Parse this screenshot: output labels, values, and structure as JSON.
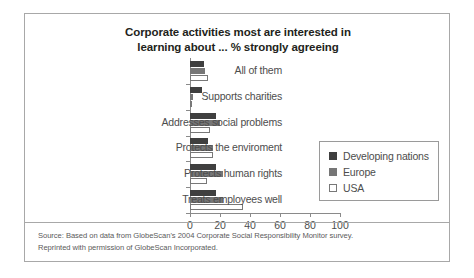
{
  "chart_data": {
    "type": "bar",
    "orientation": "horizontal",
    "title": "Corporate activities most are interested in learning about ... % strongly agreeing",
    "title_lines": [
      "Corporate activities most are interested in",
      "learning about ... % strongly agreeing"
    ],
    "categories": [
      "All of them",
      "Supports charities",
      "Addresses social problems",
      "Protects the enviroment",
      "Protects human rights",
      "Treats employees well"
    ],
    "series": [
      {
        "name": "Developing nations",
        "color": "#3f3f3f",
        "values": [
          9,
          8,
          17,
          12,
          17,
          17
        ]
      },
      {
        "name": "Europe",
        "color": "#767676",
        "values": [
          10,
          2,
          20,
          15,
          22,
          22
        ]
      },
      {
        "name": "USA",
        "color": "#ffffff",
        "values": [
          12,
          1,
          13,
          15,
          11,
          35
        ]
      }
    ],
    "xlabel": "",
    "ylabel": "",
    "xlim": [
      0,
      100
    ],
    "xticks": [
      0,
      20,
      40,
      60,
      80,
      100
    ],
    "xtick_labels": [
      "0",
      "20",
      "40",
      "60",
      "80",
      "100"
    ],
    "grid": false,
    "legend_position": "right"
  },
  "legend": {
    "items": [
      {
        "label": "Developing nations",
        "swatch": "dark-square-swatch"
      },
      {
        "label": "Europe",
        "swatch": "gray-square-swatch"
      },
      {
        "label": "USA",
        "swatch": "white-square-swatch"
      }
    ]
  },
  "source": {
    "line1": "Source: Based on data from GlobeScan's 2004 Corporate Social Responsibility Monitor survey.",
    "line2": "Reprinted with permission of GlobeScan Incorporated."
  }
}
